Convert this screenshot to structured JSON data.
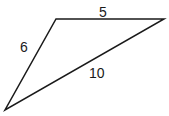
{
  "diagram": {
    "type": "triangle",
    "vertices": {
      "top_left": [
        56,
        19
      ],
      "top_right": [
        164,
        19
      ],
      "bottom": [
        5,
        110
      ]
    },
    "sides": {
      "top": "5",
      "left": "6",
      "hypotenuse": "10"
    },
    "stroke_color": "#1a1a1a"
  }
}
